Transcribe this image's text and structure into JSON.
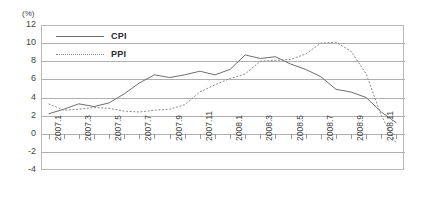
{
  "chart_data": {
    "type": "line",
    "title": "",
    "xlabel": "",
    "ylabel": "(%)",
    "ylim": [
      -4,
      12
    ],
    "ytick_values": [
      12,
      10,
      8,
      6,
      4,
      2,
      0,
      -2,
      -4
    ],
    "grid": true,
    "legend_position": "top-left inside plot",
    "x": [
      "2007.1",
      "2007.2",
      "2007.3",
      "2007.4",
      "2007.5",
      "2007.6",
      "2007.7",
      "2007.8",
      "2007.9",
      "2007.10",
      "2007.11",
      "2007.12",
      "2008.1",
      "2008.2",
      "2008.3",
      "2008.4",
      "2008.5",
      "2008.6",
      "2008.7",
      "2008.8",
      "2008.9",
      "2008.10",
      "2008.11",
      "2008.12"
    ],
    "xtick_labels": [
      "2007.1",
      "2007.3",
      "2007.5",
      "2007.7",
      "2007.9",
      "2007.11",
      "2008.1",
      "2008.3",
      "2008.5",
      "2008.7",
      "2008.9",
      "2008.11"
    ],
    "series": [
      {
        "name": "CPI",
        "style": "solid",
        "color": "#6e6e6e",
        "values": [
          2.2,
          2.7,
          3.3,
          3.0,
          3.4,
          4.4,
          5.6,
          6.5,
          6.2,
          6.5,
          6.9,
          6.5,
          7.1,
          8.7,
          8.3,
          8.5,
          7.7,
          7.1,
          6.3,
          4.9,
          4.6,
          4.0,
          2.4,
          1.2
        ]
      },
      {
        "name": "PPI",
        "style": "dotted",
        "color": "#8a8a8a",
        "values": [
          3.3,
          2.6,
          2.7,
          2.9,
          2.8,
          2.5,
          2.4,
          2.6,
          2.7,
          3.2,
          4.6,
          5.4,
          6.1,
          6.6,
          8.0,
          8.1,
          8.2,
          8.8,
          10.0,
          10.1,
          9.1,
          6.6,
          2.0,
          -1.1
        ]
      }
    ]
  }
}
